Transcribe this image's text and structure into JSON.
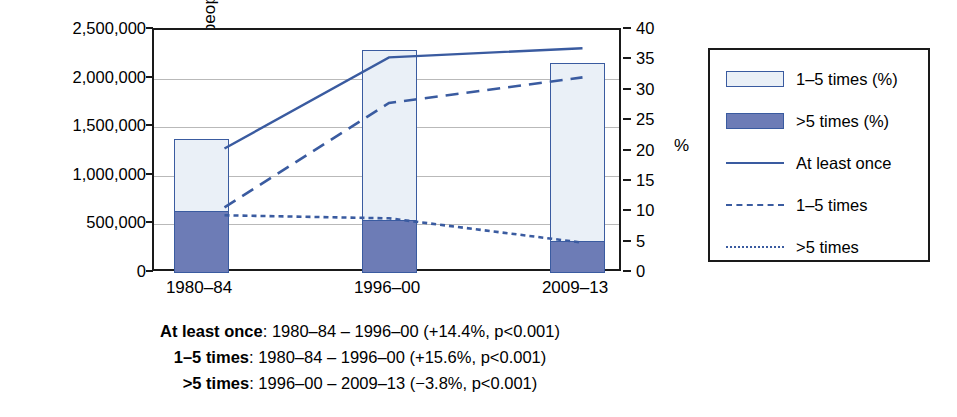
{
  "chart_data": {
    "type": "bar",
    "title": "",
    "xlabel": "",
    "ylabel": "Number of people",
    "y2label": "%",
    "categories": [
      "1980–84",
      "1996–00",
      "2009–13"
    ],
    "ylim": [
      0,
      2500000
    ],
    "y2lim": [
      0,
      40
    ],
    "grid": true,
    "legend_position": "right",
    "y_ticks": [
      "0",
      "500,000",
      "1,000,000",
      "1,500,000",
      "2,000,000",
      "2,500,000"
    ],
    "y_tick_values": [
      0,
      500000,
      1000000,
      1500000,
      2000000,
      2500000
    ],
    "y2_ticks": [
      "0",
      "5",
      "10",
      "15",
      "20",
      "25",
      "30",
      "35",
      "40"
    ],
    "y2_tick_values": [
      0,
      5,
      10,
      15,
      20,
      25,
      30,
      35,
      40
    ],
    "bar_series": [
      {
        "name": "1–5 times (%)",
        "values": [
          740000,
          1745000,
          1840000
        ],
        "fill": "#eaf0f7",
        "stroke": "#3a5ba0",
        "stacked_on": ">5 times (%)"
      },
      {
        "name": ">5 times (%)",
        "values": [
          640000,
          545000,
          325000
        ],
        "fill": "#6d7cb6",
        "stroke": "#3a5ba0"
      }
    ],
    "bar_totals": [
      1380000,
      2290000,
      2165000
    ],
    "line_series": [
      {
        "name": "At least once",
        "style": "solid",
        "color": "#3a5ba0",
        "values": [
          20.5,
          35.5,
          37.0
        ],
        "axis": "right"
      },
      {
        "name": "1–5 times",
        "style": "dashed",
        "color": "#3a5ba0",
        "values": [
          10.8,
          28.0,
          32.2
        ],
        "axis": "right"
      },
      {
        "name": ">5 times",
        "style": "dotted",
        "color": "#3a5ba0",
        "values": [
          9.5,
          9.0,
          5.0
        ],
        "axis": "right"
      }
    ],
    "legend": [
      {
        "label": "1–5 times (%)",
        "marker": "box",
        "fill": "#eaf0f7"
      },
      {
        "label": ">5 times (%)",
        "marker": "box",
        "fill": "#6d7cb6"
      },
      {
        "label": "At least once",
        "marker": "solid-line"
      },
      {
        "label": "1–5 times",
        "marker": "dashed-line"
      },
      {
        "label": ">5 times",
        "marker": "dotted-line"
      }
    ],
    "annotations": [
      {
        "series": "At least once",
        "bold": "At least once",
        "rest": ": 1980–84 – 1996–00 (+14.4%, p<0.001)"
      },
      {
        "series": "1–5 times",
        "bold": "1–5 times",
        "rest": ": 1980–84 – 1996–00 (+15.6%, p<0.001)"
      },
      {
        "series": ">5 times",
        "bold": ">5 times",
        "rest": ": 1996–00 – 2009–13 (−3.8%, p<0.001)"
      }
    ]
  },
  "colors": {
    "accent": "#3a5ba0",
    "bar_dark": "#6d7cb6",
    "bar_light": "#eaf0f7",
    "grid": "#b9b9b9",
    "axis": "#1a1a1a"
  }
}
